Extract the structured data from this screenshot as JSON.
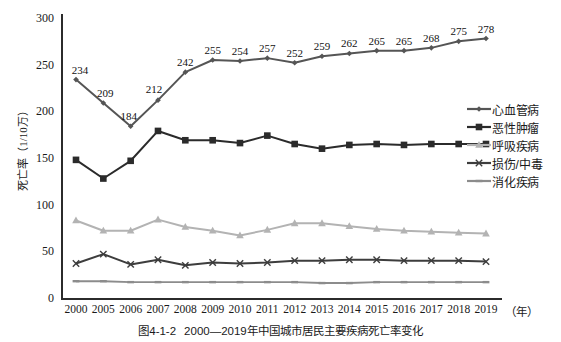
{
  "chart_data": {
    "type": "line",
    "title": "",
    "caption_number": "图4-1-2",
    "caption_text": "2000—2019年中国城市居民主要疾病死亡率变化",
    "xlabel": "（年）",
    "ylabel": "死亡率（1/10万）",
    "ylim": [
      0,
      300
    ],
    "yticks": [
      0,
      50,
      100,
      150,
      200,
      250,
      300
    ],
    "grid": false,
    "legend_position": "right",
    "categories": [
      "2000",
      "2005",
      "2006",
      "2007",
      "2008",
      "2009",
      "2010",
      "2011",
      "2012",
      "2013",
      "2014",
      "2015",
      "2016",
      "2017",
      "2018",
      "2019"
    ],
    "series": [
      {
        "name": "心血管病",
        "color": "#555555",
        "marker": "diamond",
        "values": [
          234,
          209,
          184,
          212,
          242,
          255,
          254,
          257,
          252,
          259,
          262,
          265,
          265,
          268,
          275,
          278
        ],
        "labels": [
          "234",
          "209",
          "184",
          "212",
          "242",
          "255",
          "254",
          "257",
          "252",
          "259",
          "262",
          "265",
          "265",
          "268",
          "275",
          "278"
        ],
        "show_labels": true
      },
      {
        "name": "恶性肿瘤",
        "color": "#2b2b2b",
        "marker": "square",
        "values": [
          148,
          128,
          147,
          179,
          169,
          169,
          166,
          174,
          165,
          160,
          164,
          165,
          164,
          165,
          165,
          165
        ],
        "show_labels": false
      },
      {
        "name": "呼吸疾病",
        "color": "#b3b3b3",
        "marker": "triangle",
        "values": [
          83,
          72,
          72,
          84,
          76,
          72,
          67,
          73,
          80,
          80,
          77,
          74,
          72,
          71,
          70,
          69
        ],
        "show_labels": false
      },
      {
        "name": "损伤/中毒",
        "color": "#3d3d3d",
        "marker": "x",
        "values": [
          37,
          47,
          36,
          41,
          35,
          38,
          37,
          38,
          40,
          40,
          41,
          41,
          40,
          40,
          40,
          39
        ],
        "show_labels": false
      },
      {
        "name": "消化疾病",
        "color": "#8c8c8c",
        "marker": "line",
        "values": [
          18,
          18,
          17,
          17,
          17,
          17,
          17,
          17,
          17,
          16,
          16,
          17,
          17,
          17,
          17,
          17
        ],
        "show_labels": false
      }
    ]
  },
  "axis": {
    "y_unit_note": "1/10万",
    "x_unit": "（年）"
  }
}
